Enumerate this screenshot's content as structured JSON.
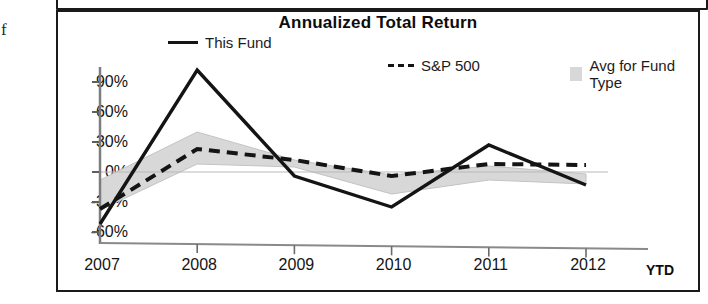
{
  "margin_glyph": "f",
  "chart": {
    "title": "Annualized Total Return",
    "ytd_label": "YTD",
    "legend": [
      {
        "key": "this_fund",
        "label": "This Fund",
        "marker": "solid-line-swatch",
        "color": "#141414"
      },
      {
        "key": "sp500",
        "label": "S&P 500",
        "marker": "dashed-line-swatch",
        "color": "#141414"
      },
      {
        "key": "avg_fund_type",
        "label": "Avg for Fund Type",
        "marker": "gray-box-swatch",
        "color": "#d8d8d8"
      }
    ]
  },
  "chart_data": {
    "type": "line",
    "title": "Annualized Total Return",
    "xlabel": "",
    "ylabel": "",
    "categories": [
      "2007",
      "2008",
      "2009",
      "2010",
      "2011",
      "2012"
    ],
    "x_tick_labels": [
      "2007",
      "2008",
      "2009",
      "2010",
      "2011",
      "2012"
    ],
    "y_tick_labels": [
      "90%",
      "60%",
      "30%",
      "0%",
      "-30%",
      "-60%"
    ],
    "y_ticks": [
      90,
      60,
      30,
      0,
      -30,
      -60
    ],
    "ylim": [
      -60,
      105
    ],
    "grid": false,
    "legend_position": "top",
    "note": "Last category 2012 is year-to-date (YTD)",
    "series": [
      {
        "name": "This Fund",
        "style": "solid",
        "color": "#141414",
        "values": [
          -52,
          102,
          -4,
          -35,
          27,
          -13
        ]
      },
      {
        "name": "S&P 500",
        "style": "dashed",
        "color": "#141414",
        "values": [
          -37,
          23,
          12,
          -4,
          8,
          7
        ]
      },
      {
        "name": "Avg for Fund Type",
        "style": "shaded-band",
        "color": "#d8d8d8",
        "upper": [
          -8,
          40,
          12,
          -3,
          6,
          -2
        ],
        "lower": [
          -38,
          8,
          5,
          -22,
          -8,
          -12
        ]
      }
    ]
  }
}
